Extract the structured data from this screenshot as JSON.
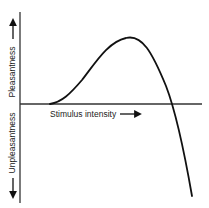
{
  "diagram": {
    "type": "curve",
    "y_axis": {
      "positive_label": "Pleasantness",
      "negative_label": "Unpleasantness"
    },
    "x_axis": {
      "label": "Stimulus intensity"
    },
    "curve": {
      "shape": "rises from zero, peaks, then falls steeply below zero",
      "key_points": [
        {
          "name": "onset",
          "x": 0.17,
          "y": 0.0
        },
        {
          "name": "peak",
          "x": 0.6,
          "y": 1.0
        },
        {
          "name": "zero-crossing",
          "x": 0.83,
          "y": 0.0
        },
        {
          "name": "end",
          "x": 0.95,
          "y": -1.4
        }
      ]
    },
    "colors": {
      "line": "#111111",
      "axis": "#333333",
      "text": "#222222"
    }
  }
}
